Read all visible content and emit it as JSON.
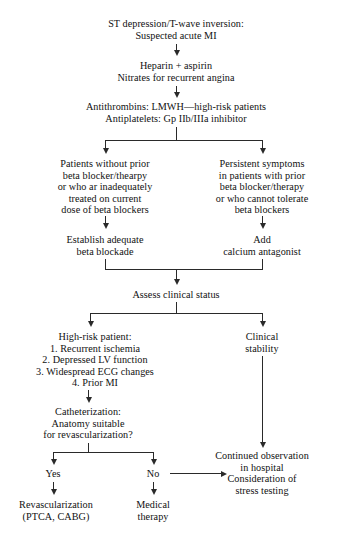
{
  "diagram": {
    "line_color": "#2a2a2a",
    "background": "#ffffff",
    "nodes": {
      "n1": "ST depression/T-wave inversion:\nSuspected acute MI",
      "n2": "Heparin + aspirin\nNitrates for recurrent angina",
      "n3": "Antithrombins: LMWH—high-risk patients\nAntiplatelets: Gp IIb/IIIa inhibitor",
      "n4_left": "Patients without prior\nbeta blocker/thearpy\nor who ar inadequately\ntreated on current\ndose of beta blockers",
      "n4_right": "Persistent symptoms\nin patients with prior\nbeta blocker/therapy\nor who cannot tolerate\nbeta blockers",
      "n5_left": "Establish adequate\nbeta blockade",
      "n5_right": "Add\ncalcium antagonist",
      "n6": "Assess clinical status",
      "n7_left": "High-risk patient:\n1. Recurrent ischemia\n2. Depressed LV function\n3. Widespread ECG changes\n4. Prior MI",
      "n7_right": "Clinical\nstability",
      "n8": "Catheterization:\nAnatomy suitable\nfor revascularization?",
      "n9_yes": "Yes",
      "n9_no": "No",
      "n10_left": "Revascularization\n(PTCA, CABG)",
      "n10_mid": "Medical\ntherapy",
      "n10_right": "Continued observation\nin hospital\nConsideration of\nstress testing"
    }
  }
}
